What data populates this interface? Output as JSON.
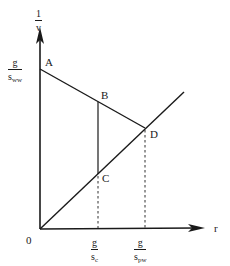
{
  "diagram": {
    "y_axis": {
      "label_numerator": "1",
      "label_denominator": "v"
    },
    "x_axis": {
      "label": "r",
      "origin_label": "0"
    },
    "points": {
      "A": "A",
      "B": "B",
      "C": "C",
      "D": "D"
    },
    "y_tick": {
      "numerator": "g",
      "denominator_base": "s",
      "denominator_sub": "ww"
    },
    "x_ticks": [
      {
        "numerator": "g",
        "denominator_base": "s",
        "denominator_sub": "c"
      },
      {
        "numerator": "g",
        "denominator_base": "s",
        "denominator_sub": "pw"
      }
    ],
    "colors": {
      "line": "#1a1a1a",
      "background": "#ffffff"
    }
  }
}
